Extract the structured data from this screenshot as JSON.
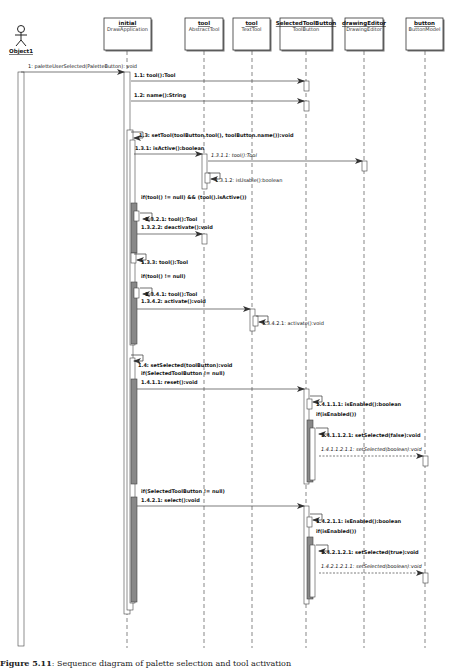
{
  "diagram": {
    "type": "uml-sequence-diagram",
    "actor": {
      "name": "Object1",
      "x": 21
    },
    "lifelines": [
      {
        "id": "initial",
        "name": "initial",
        "type": "DrawApplication",
        "x": 127,
        "box_x": 104,
        "box_w": 47
      },
      {
        "id": "tool",
        "name": "tool",
        "type": "AbstractTool",
        "x": 204,
        "box_x": 185,
        "box_w": 38
      },
      {
        "id": "tool2",
        "name": "tool",
        "type": "TextTool",
        "x": 252,
        "box_x": 233,
        "box_w": 37
      },
      {
        "id": "selected",
        "name": "SelectedToolButton",
        "type": "ToolButton",
        "x": 306,
        "box_x": 280,
        "box_w": 52
      },
      {
        "id": "drawingEditor",
        "name": "drawingEditor",
        "type": "DrawingEditor",
        "x": 364,
        "box_x": 345,
        "box_w": 38
      },
      {
        "id": "button",
        "name": "button",
        "type": "ButtonModel",
        "x": 425,
        "box_x": 406,
        "box_w": 37
      }
    ],
    "messages": [
      {
        "id": "m1",
        "label": "1: paletteUserSelected(PaletteButton): void",
        "from": 21,
        "to": 124,
        "y": 72,
        "lx": 28,
        "ly": 68,
        "bold": false,
        "italic": false,
        "dashed": false
      },
      {
        "id": "m1_1",
        "label": "1.1: tool():Tool",
        "from": 131,
        "to": 304,
        "y": 81,
        "lx": 134,
        "ly": 77,
        "bold": true
      },
      {
        "id": "m1_2",
        "label": "1.2: name():String",
        "from": 131,
        "to": 304,
        "y": 101,
        "lx": 134,
        "ly": 97,
        "bold": true
      },
      {
        "id": "m1_3",
        "label": "1.3: setTool(toolButton.tool(), toolButton.name()):void",
        "self": true,
        "x": 131,
        "y": 132,
        "lx": 139,
        "ly": 137,
        "bold": true
      },
      {
        "id": "m1_3_1",
        "label": "1.3.1: isActive():boolean",
        "from": 134,
        "to": 202,
        "y": 154,
        "lx": 135,
        "ly": 150,
        "bold": true
      },
      {
        "id": "m1_3_1_1",
        "label": "1.3.1.1: tool():Tool",
        "from": 208,
        "to": 362,
        "y": 161,
        "lx": 211,
        "ly": 157,
        "italic": true
      },
      {
        "id": "m1_3_1_2",
        "label": "1.3.1.2: isUsable():boolean",
        "self": true,
        "x": 208,
        "y": 173,
        "lx": 215,
        "ly": 182,
        "bold": false
      },
      {
        "id": "m1_3_2_1",
        "label": "1.3.2.1: tool():Tool",
        "self": true,
        "x": 140,
        "y": 213,
        "lx": 145,
        "ly": 221,
        "bold": true
      },
      {
        "id": "m1_3_2_2",
        "label": "1.3.2.2: deactivate():void",
        "from": 137,
        "to": 202,
        "y": 234,
        "lx": 141,
        "ly": 229,
        "bold": true
      },
      {
        "id": "m1_3_3",
        "label": "1.3.3: tool():Tool",
        "self": true,
        "x": 134,
        "y": 254,
        "lx": 141,
        "ly": 264,
        "bold": true
      },
      {
        "id": "m1_3_4_1",
        "label": "1.3.4.1: tool():Tool",
        "self": true,
        "x": 140,
        "y": 288,
        "lx": 145,
        "ly": 296,
        "bold": true
      },
      {
        "id": "m1_3_4_2",
        "label": "1.3.4.2: activate():void",
        "from": 137,
        "to": 250,
        "y": 309,
        "lx": 141,
        "ly": 303,
        "bold": true
      },
      {
        "id": "m1_3_4_2_1",
        "label": "1.3.4.2.1: activate():void",
        "self": true,
        "x": 256,
        "y": 316,
        "lx": 262,
        "ly": 325,
        "bold": false
      },
      {
        "id": "m1_4",
        "label": "1.4: setSelected(toolButton):void",
        "self": true,
        "x": 131,
        "y": 355,
        "lx": 138,
        "ly": 367,
        "bold": true
      },
      {
        "id": "m1_4_1_1",
        "label": "1.4.1.1: reset():void",
        "from": 137,
        "to": 304,
        "y": 389,
        "lx": 141,
        "ly": 384,
        "bold": true
      },
      {
        "id": "m1_4_1_1_1",
        "label": "1.4.1.1.1: isEnabled():boolean",
        "self": true,
        "x": 310,
        "y": 396,
        "lx": 316,
        "ly": 406,
        "bold": true
      },
      {
        "id": "m1_4_1_1_2_1",
        "label": "1.4.1.1.2.1: setSelected(false):void",
        "self": true,
        "x": 316,
        "y": 428,
        "lx": 321,
        "ly": 437,
        "bold": true
      },
      {
        "id": "m1_4_1_1_2_1_1",
        "label": "1.4.1.1.2.1.1: setSelected(boolean):void",
        "from": 319,
        "to": 423,
        "y": 456,
        "lx": 321,
        "ly": 451,
        "italic": true,
        "dashed": true
      },
      {
        "id": "m1_4_2_1",
        "label": "1.4.2.1: select():void",
        "from": 137,
        "to": 304,
        "y": 506,
        "lx": 141,
        "ly": 502,
        "bold": true
      },
      {
        "id": "m1_4_2_1_1",
        "label": "1.4.2.1.1: isEnabled():boolean",
        "self": true,
        "x": 310,
        "y": 514,
        "lx": 316,
        "ly": 523,
        "bold": true
      },
      {
        "id": "m1_4_2_1_2_1",
        "label": "1.4.2.1.2.1: setSelected(true):void",
        "self": true,
        "x": 316,
        "y": 545,
        "lx": 321,
        "ly": 554,
        "bold": true
      },
      {
        "id": "m1_4_2_1_2_1_1",
        "label": "1.4.2.1.2.1.1: setSelected(boolean):void",
        "from": 319,
        "to": 423,
        "y": 573,
        "lx": 321,
        "ly": 568,
        "italic": true,
        "dashed": true
      }
    ],
    "guards": [
      {
        "id": "g1",
        "label": "if(tool() != null) && (tool().isActive())",
        "x": 141,
        "y": 199
      },
      {
        "id": "g2",
        "label": "if(tool() != null)",
        "x": 141,
        "y": 278
      },
      {
        "id": "g3",
        "label": "if(SelectedToolButton != null)",
        "x": 141,
        "y": 375
      },
      {
        "id": "g4",
        "label": "if(isEnabled())",
        "x": 316,
        "y": 416
      },
      {
        "id": "g5",
        "label": "if(SelectedToolButton != null)",
        "x": 141,
        "y": 493
      },
      {
        "id": "g6",
        "label": "if(isEnabled())",
        "x": 316,
        "y": 533
      }
    ],
    "activations": [
      {
        "x": 18,
        "y": 72,
        "w": 6,
        "h": 574,
        "fill": "#ffffff"
      },
      {
        "x": 124,
        "y": 72,
        "w": 6,
        "h": 542,
        "fill": "#ffffff"
      },
      {
        "x": 127,
        "y": 130,
        "w": 6,
        "h": 480,
        "fill": "#ffffff"
      },
      {
        "x": 130,
        "y": 140,
        "w": 5,
        "h": 205,
        "fill": "#ffffff"
      },
      {
        "x": 131,
        "y": 203,
        "w": 6,
        "h": 50,
        "fill": "#888888"
      },
      {
        "x": 134,
        "y": 211,
        "w": 5,
        "h": 10,
        "fill": "#ffffff"
      },
      {
        "x": 131,
        "y": 253,
        "w": 5,
        "h": 10,
        "fill": "#ffffff"
      },
      {
        "x": 131,
        "y": 282,
        "w": 6,
        "h": 62,
        "fill": "#888888"
      },
      {
        "x": 134,
        "y": 288,
        "w": 5,
        "h": 10,
        "fill": "#ffffff"
      },
      {
        "x": 130,
        "y": 358,
        "w": 5,
        "h": 245,
        "fill": "#ffffff"
      },
      {
        "x": 131,
        "y": 379,
        "w": 6,
        "h": 105,
        "fill": "#888888"
      },
      {
        "x": 131,
        "y": 497,
        "w": 6,
        "h": 105,
        "fill": "#888888"
      },
      {
        "x": 202,
        "y": 154,
        "w": 5,
        "h": 35,
        "fill": "#ffffff"
      },
      {
        "x": 205,
        "y": 173,
        "w": 5,
        "h": 10,
        "fill": "#ffffff"
      },
      {
        "x": 202,
        "y": 234,
        "w": 5,
        "h": 10,
        "fill": "#ffffff"
      },
      {
        "x": 250,
        "y": 309,
        "w": 5,
        "h": 22,
        "fill": "#ffffff"
      },
      {
        "x": 253,
        "y": 316,
        "w": 5,
        "h": 10,
        "fill": "#ffffff"
      },
      {
        "x": 304,
        "y": 81,
        "w": 5,
        "h": 10,
        "fill": "#ffffff"
      },
      {
        "x": 304,
        "y": 101,
        "w": 5,
        "h": 10,
        "fill": "#ffffff"
      },
      {
        "x": 362,
        "y": 161,
        "w": 5,
        "h": 10,
        "fill": "#ffffff"
      },
      {
        "x": 304,
        "y": 389,
        "w": 5,
        "h": 95,
        "fill": "#ffffff"
      },
      {
        "x": 307,
        "y": 399,
        "w": 5,
        "h": 10,
        "fill": "#ffffff"
      },
      {
        "x": 307,
        "y": 420,
        "w": 6,
        "h": 62,
        "fill": "#888888"
      },
      {
        "x": 310,
        "y": 428,
        "w": 5,
        "h": 52,
        "fill": "#ffffff"
      },
      {
        "x": 423,
        "y": 456,
        "w": 5,
        "h": 10,
        "fill": "#ffffff"
      },
      {
        "x": 304,
        "y": 506,
        "w": 5,
        "h": 98,
        "fill": "#ffffff"
      },
      {
        "x": 307,
        "y": 517,
        "w": 5,
        "h": 10,
        "fill": "#ffffff"
      },
      {
        "x": 307,
        "y": 537,
        "w": 6,
        "h": 62,
        "fill": "#888888"
      },
      {
        "x": 310,
        "y": 545,
        "w": 5,
        "h": 52,
        "fill": "#ffffff"
      },
      {
        "x": 423,
        "y": 573,
        "w": 5,
        "h": 10,
        "fill": "#ffffff"
      }
    ]
  },
  "caption": {
    "label": "Figure 5.11",
    "text": ": Sequence diagram of palette selection and tool activation"
  },
  "colors": {
    "line": "#555555",
    "border": "#333333",
    "activation_dark": "#888888",
    "background": "#ffffff"
  }
}
